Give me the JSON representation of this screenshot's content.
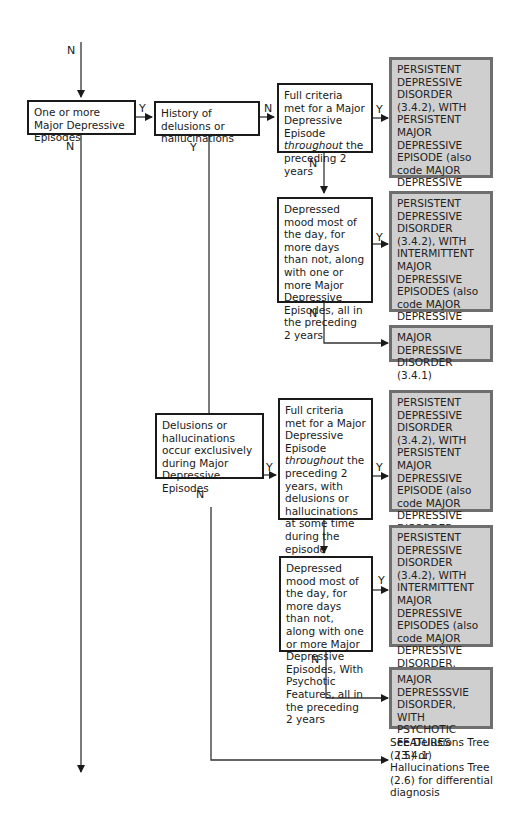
{
  "diagram": {
    "entry_label": "N",
    "nodes": {
      "q_mde": {
        "text": "One or more Major Depressive Episodes",
        "yes": "Y",
        "no": "N"
      },
      "q_history": {
        "text": "History of delusions or hallucinations",
        "yes": "Y",
        "no": "N"
      },
      "q_full_criteria": {
        "text_pre": "Full criteria met for a Major Depressive Episode ",
        "text_em": "throughout",
        "text_post": " the preceding 2 years",
        "yes": "Y",
        "no": "N"
      },
      "q_depressed_mood": {
        "text": "Depressed mood most of the day, for more days than not, along with one or more Major Depressive Episodes, all in the preceding 2 years",
        "yes": "Y",
        "no": "N"
      },
      "q_delusions_exclusive": {
        "text": "Delusions or hallucinations occur exclusively during Major Depressive Episodes",
        "yes": "Y",
        "no": "N"
      },
      "q_full_criteria_psychotic": {
        "text_pre": "Full criteria met for a Major Depressive Episode ",
        "text_em": "throughout",
        "text_post": " the preceding 2 years, with delusions or hallucinations at some time during the episode",
        "yes": "Y",
        "no": "N"
      },
      "q_depressed_mood_psychotic": {
        "text": "Depressed mood most of the day, for more days than not, along with one or more Major Depressive Episodes, With Psychotic Features, all in the preceding 2 years",
        "yes": "Y",
        "no": "N"
      }
    },
    "diagnoses": {
      "pdd_persistent_mde": "PERSISTENT DEPRESSIVE DISORDER (3.4.2), WITH PERSISTENT MAJOR DEPRESSIVE EPISODE (also code MAJOR DEPRESSIVE DISORDER to indicate episode severity)",
      "pdd_intermittent_mde": "PERSISTENT DEPRESSIVE DISORDER (3.4.2), WITH INTERMITTENT MAJOR DEPRESSIVE EPISODES (also code MAJOR DEPRESSIVE DISORDER to indicate episode severity)",
      "mdd": "MAJOR DEPRESSIVE DISORDER (3.4.1)",
      "pdd_persistent_mde_psychotic": "PERSISTENT DEPRESSIVE DISORDER (3.4.2), WITH PERSISTENT MAJOR DEPRESSIVE EPISODE (also code MAJOR DEPRESSIVE DISORDER, WITH PSYCHOTIC FEATURES)",
      "pdd_intermittent_mde_psychotic": "PERSISTENT DEPRESSIVE DISORDER (3.4.2), WITH INTERMITTENT MAJOR DEPRESSIVE EPISODES (also code MAJOR DEPRESSIVE DISORDER, WITH PSYCHOTIC FEATURES)",
      "mdd_psychotic": "MAJOR DEPRESSSVIE DISORDER, WITH PSYCHOTIC FEATURES (3.4.1)"
    },
    "referral_note": "See Delusions Tree (2.5) or Hallucinations Tree (2.6) for differential diagnosis"
  }
}
